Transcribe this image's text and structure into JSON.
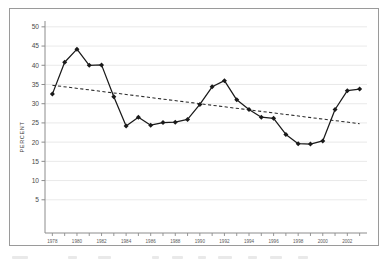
{
  "chart_data": {
    "type": "line",
    "title": "",
    "subtitle": "",
    "xlabel": "",
    "ylabel": "PERCENT",
    "xlim": [
      1977.4,
      2003.6
    ],
    "ylim": [
      0,
      51
    ],
    "yticks": [
      5,
      10,
      15,
      20,
      25,
      30,
      35,
      40,
      45,
      50
    ],
    "ytick_labels": [
      "5",
      "10",
      "15",
      "20",
      "25",
      "30",
      "35",
      "40",
      "45",
      "50"
    ],
    "xticks": [
      1978,
      1980,
      1982,
      1984,
      1986,
      1988,
      1990,
      1992,
      1994,
      1996,
      1998,
      2000,
      2002
    ],
    "xtick_labels": [
      "1978",
      "1980",
      "1982",
      "1984",
      "1986",
      "1988",
      "1990",
      "1992",
      "1994",
      "1996",
      "1998",
      "2000",
      "2002"
    ],
    "x_minor_ticks_every": 1,
    "grid": "horizontal",
    "grid_color": "#e3e3e3",
    "legend": "none",
    "x": [
      1978,
      1979,
      1980,
      1981,
      1982,
      1983,
      1984,
      1985,
      1986,
      1987,
      1988,
      1989,
      1990,
      1991,
      1992,
      1993,
      1994,
      1995,
      1996,
      1997,
      1998,
      1999,
      2000,
      2001,
      2002,
      2003
    ],
    "series": [
      {
        "name": "percent",
        "style": "solid-line-with-diamond-markers",
        "color": "#1a1a1a",
        "values": [
          32.5,
          40.8,
          44.2,
          40.0,
          40.1,
          31.8,
          24.2,
          26.5,
          24.4,
          25.1,
          25.2,
          25.9,
          29.8,
          34.4,
          36.0,
          31.0,
          28.5,
          26.5,
          26.2,
          22.0,
          19.6,
          19.5,
          20.3,
          28.5,
          33.4,
          33.8
        ]
      },
      {
        "name": "trend",
        "style": "dashed-trend-line",
        "color": "#2a2a2a",
        "x_endpoints": [
          1978,
          2003
        ],
        "y_endpoints": [
          34.8,
          24.8
        ]
      }
    ]
  },
  "axes": {
    "y_axis_title": "PERCENT"
  }
}
